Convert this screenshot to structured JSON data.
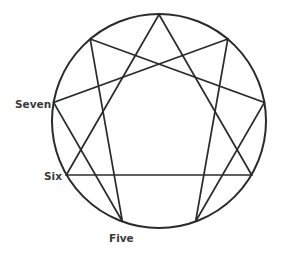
{
  "diagram": {
    "type": "enneagram",
    "stroke_color": "#2b2b2b",
    "background": "#ffffff",
    "circle": {
      "cx": 159,
      "cy": 121,
      "r": 107
    },
    "points": [
      {
        "id": 9,
        "x": 159.0,
        "y": 14.5
      },
      {
        "id": 1,
        "x": 227.8,
        "y": 39.0
      },
      {
        "id": 2,
        "x": 264.4,
        "y": 102.4
      },
      {
        "id": 3,
        "x": 251.7,
        "y": 175.0
      },
      {
        "id": 4,
        "x": 195.6,
        "y": 221.5
      },
      {
        "id": 5,
        "x": 122.4,
        "y": 221.5
      },
      {
        "id": 6,
        "x": 66.3,
        "y": 175.0
      },
      {
        "id": 7,
        "x": 53.6,
        "y": 102.4
      },
      {
        "id": 8,
        "x": 90.2,
        "y": 39.0
      }
    ],
    "triangle": [
      3,
      6,
      9
    ],
    "hexad": [
      1,
      4,
      2,
      8,
      5,
      7
    ],
    "labels": {
      "seven": "Seven",
      "six": "Six",
      "five": "Five"
    }
  }
}
